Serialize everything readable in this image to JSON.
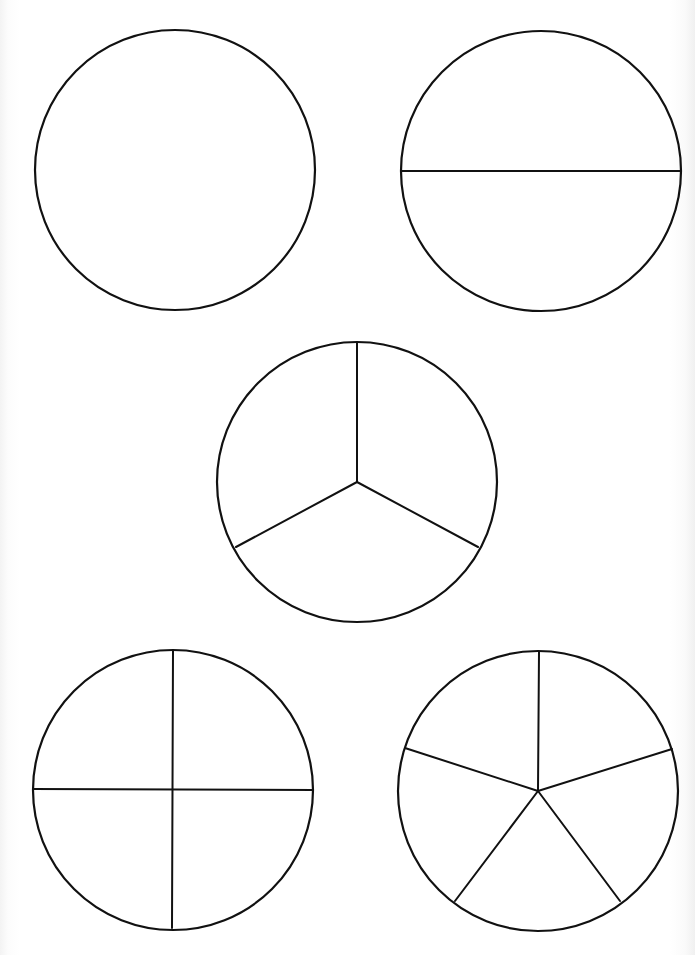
{
  "worksheet": {
    "title": "",
    "stroke_color": "#111111",
    "background_color": "#ffffff",
    "circles": [
      {
        "id": "whole",
        "parts": 1,
        "cx": 175,
        "cy": 170,
        "r": 140,
        "divider_lines": []
      },
      {
        "id": "halves",
        "parts": 2,
        "cx": 541,
        "cy": 171,
        "r": 140,
        "divider_lines": [
          {
            "x1": 401,
            "y1": 171,
            "x2": 681,
            "y2": 171
          }
        ]
      },
      {
        "id": "thirds",
        "parts": 3,
        "cx": 357,
        "cy": 482,
        "r": 140,
        "divider_lines": [
          {
            "x1": 357,
            "y1": 482,
            "x2": 357,
            "y2": 344
          },
          {
            "x1": 357,
            "y1": 482,
            "x2": 237,
            "y2": 547
          },
          {
            "x1": 357,
            "y1": 482,
            "x2": 477,
            "y2": 547
          }
        ]
      },
      {
        "id": "quarters",
        "parts": 4,
        "cx": 173,
        "cy": 790,
        "r": 140,
        "divider_lines": [
          {
            "x1": 173,
            "y1": 653,
            "x2": 172,
            "y2": 926
          },
          {
            "x1": 33,
            "y1": 789,
            "x2": 313,
            "y2": 790
          }
        ]
      },
      {
        "id": "fifths",
        "parts": 5,
        "cx": 538,
        "cy": 791,
        "r": 140,
        "divider_lines": [
          {
            "x1": 538,
            "y1": 791,
            "x2": 539,
            "y2": 655
          },
          {
            "x1": 538,
            "y1": 791,
            "x2": 671,
            "y2": 749
          },
          {
            "x1": 538,
            "y1": 791,
            "x2": 619,
            "y2": 900
          },
          {
            "x1": 538,
            "y1": 791,
            "x2": 456,
            "y2": 900
          },
          {
            "x1": 538,
            "y1": 791,
            "x2": 406,
            "y2": 748
          }
        ]
      }
    ]
  }
}
